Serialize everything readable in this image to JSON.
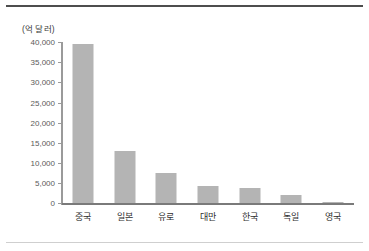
{
  "chart_data": {
    "type": "bar",
    "title": "",
    "subtitle": "",
    "unit_label": "(억 달러)",
    "xlabel": "",
    "ylabel": "",
    "categories": [
      "중국",
      "일본",
      "유로",
      "대만",
      "한국",
      "독일",
      "영국"
    ],
    "values": [
      39500,
      13000,
      7600,
      4200,
      3900,
      2000,
      300
    ],
    "series": [
      {
        "name": "외환보유액",
        "values": [
          39500,
          13000,
          7600,
          4200,
          3900,
          2000,
          300
        ]
      }
    ],
    "ylim": [
      0,
      40000
    ],
    "yticks": [
      0,
      5000,
      10000,
      15000,
      20000,
      25000,
      30000,
      35000,
      40000
    ],
    "ytick_labels": [
      "0",
      "5,000",
      "10,000",
      "15,000",
      "20,000",
      "25,000",
      "30,000",
      "35,000",
      "40,000"
    ],
    "grid": false,
    "legend": false,
    "legend_position": "none",
    "bar_color": "#b4b4b4",
    "axis_color": "#7a7a7a",
    "text_color": "#2e2e2e",
    "background_color": "#ffffff",
    "border_top_color": "#4d4d4d",
    "border_bottom_color": "#cfcfcf"
  }
}
